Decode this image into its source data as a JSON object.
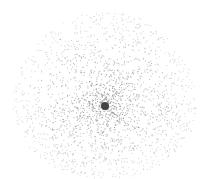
{
  "figure": {
    "background": "#ffffff",
    "dot_color": "#8a8a8a",
    "center_dot_color": "#444444",
    "center": {
      "x": 105,
      "y": 106
    },
    "center_dot_radius": 4,
    "cloud_radius_x": 92,
    "cloud_radius_y": 86,
    "point_count": 2200,
    "point_radius": 0.55
  }
}
